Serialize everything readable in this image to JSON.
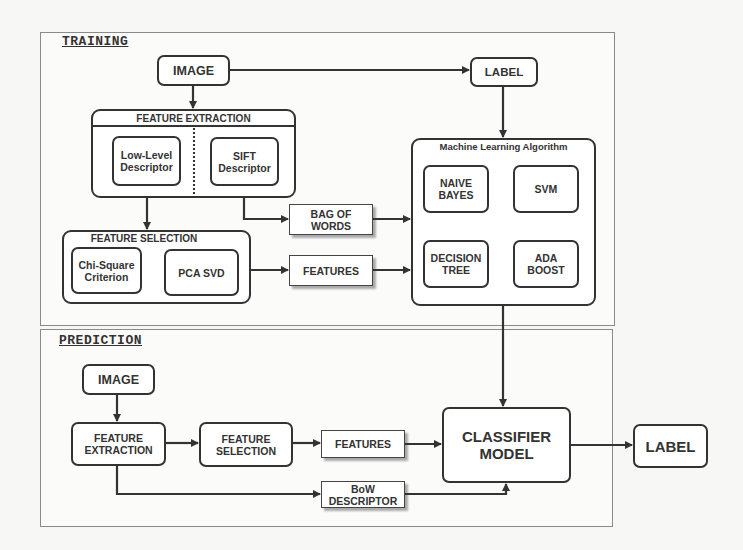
{
  "training": {
    "title": "TRAINING",
    "image_label": "IMAGE",
    "label_label": "LABEL",
    "feature_extraction": {
      "title": "FEATURE EXTRACTION",
      "items": [
        "Low-Level\nDescriptor",
        "SIFT\nDescriptor"
      ]
    },
    "feature_selection": {
      "title": "FEATURE SELECTION",
      "items": [
        "Chi-Square\nCriterion",
        "PCA SVD"
      ]
    },
    "bag_of_words": "BAG OF\nWORDS",
    "features": "FEATURES",
    "ml_algorithm": {
      "title": "Machine Learning Algorithm",
      "items": [
        "NAIVE\nBAYES",
        "SVM",
        "DECISION\nTREE",
        "ADA\nBOOST"
      ]
    }
  },
  "prediction": {
    "title": "PREDICTION",
    "image_label": "IMAGE",
    "feature_extraction": "FEATURE\nEXTRACTION",
    "feature_selection": "FEATURE\nSELECTION",
    "features": "FEATURES",
    "bow_descriptor": "BoW\nDESCRIPTOR",
    "classifier_model": "CLASSIFIER\nMODEL",
    "output_label": "LABEL"
  }
}
